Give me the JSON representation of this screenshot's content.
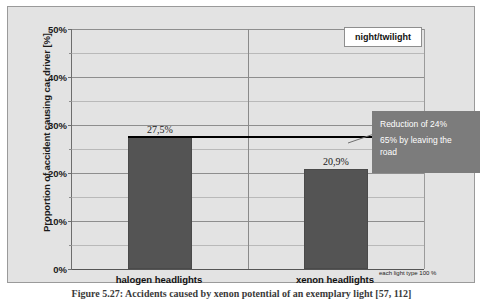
{
  "chart_data": {
    "type": "bar",
    "title": "",
    "subtitle": "",
    "categories": [
      "halogen headlights",
      "xenon headlights"
    ],
    "values": [
      27.5,
      20.9
    ],
    "value_labels": [
      "27,5%",
      "20,9%"
    ],
    "xlabel": "",
    "ylabel": "Proportion of accident causing car driver [%]",
    "ylim": [
      0,
      50
    ],
    "y_ticks": [
      "0%",
      "10%",
      "20%",
      "30%",
      "40%",
      "50%"
    ],
    "y_tick_values": [
      0,
      10,
      20,
      30,
      40,
      50
    ],
    "y_minor_tick_values": [
      5,
      15,
      25,
      35,
      45
    ],
    "grid": true,
    "legend_position": "top-right",
    "legend_entries": [
      "night/twilight"
    ],
    "series": [
      {
        "name": "night/twilight",
        "values": [
          27.5,
          20.9
        ],
        "color": "#545454"
      }
    ],
    "annotations": [
      {
        "name": "reduction-callout",
        "line1": "Reduction of 24%",
        "line2": "65% by leaving the",
        "line3": "road",
        "background": "#7c7c7c",
        "text_color": "#ffffff"
      },
      {
        "name": "reference-line",
        "value": 27.5,
        "color": "#000000"
      },
      {
        "name": "footnote",
        "text": "each light type 100 %"
      }
    ]
  },
  "legend": {
    "label": "night/twilight"
  },
  "axis": {
    "y_title": "Proportion of accident causing car driver [%]",
    "ticks": [
      {
        "label": "50%",
        "value": 50
      },
      {
        "label": "40%",
        "value": 40
      },
      {
        "label": "30%",
        "value": 30
      },
      {
        "label": "20%",
        "value": 20
      },
      {
        "label": "10%",
        "value": 10
      },
      {
        "label": "0%",
        "value": 0
      }
    ],
    "categories": [
      {
        "label": "halogen headlights"
      },
      {
        "label": "xenon headlights"
      }
    ]
  },
  "bars": [
    {
      "label": "27,5%",
      "value": 27.5,
      "category": "halogen headlights"
    },
    {
      "label": "20,9%",
      "value": 20.9,
      "category": "xenon headlights"
    }
  ],
  "callout": {
    "line1": "Reduction of 24%",
    "line2": "65% by leaving the",
    "line3": "road"
  },
  "footnote": {
    "text": "each light type 100 %"
  },
  "caption": {
    "text": "Figure 5.27:  Accidents caused by xenon potential of an exemplary light [57, 112]"
  },
  "colors": {
    "bar": "#545454",
    "plot_background": "#e3e3e3",
    "callout_background": "#7c7c7c",
    "reference_line": "#000000",
    "gridline_major": "#8e8e8e",
    "gridline_minor": "#b9b9b9"
  }
}
